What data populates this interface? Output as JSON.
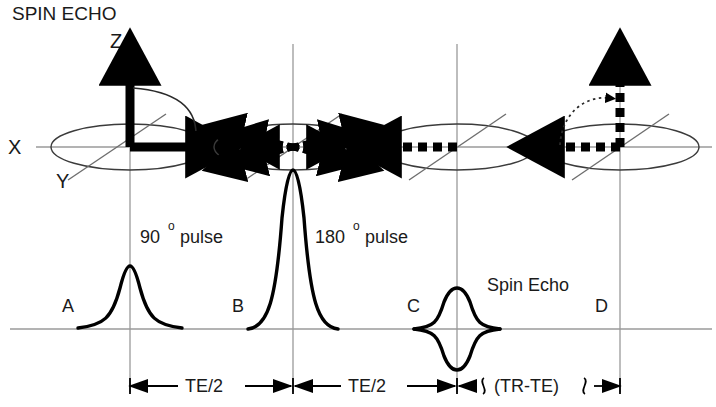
{
  "title": "SPIN ECHO",
  "axes": {
    "z_label": "Z",
    "x_label": "X",
    "y_label": "Y"
  },
  "panels": [
    {
      "letter": "A",
      "state": "longitudinal-magnetization-tipped-to-transverse-plane",
      "center_x": 130
    },
    {
      "letter": "B",
      "state": "spins-dephasing-in-transverse-plane",
      "center_x": 293
    },
    {
      "letter": "C",
      "state": "spins-rephased-echo-formation",
      "center_x": 457
    },
    {
      "letter": "D",
      "state": "longitudinal-recovery-t1-relaxation",
      "center_x": 620
    }
  ],
  "pulses": [
    {
      "name": "ninety-degree-pulse",
      "base_label": "90",
      "degree_symbol": "o",
      "suffix_label": "pulse",
      "center_x": 130,
      "amplitude": 60
    },
    {
      "name": "one-eighty-degree-pulse",
      "base_label": "180",
      "degree_symbol": "o",
      "suffix_label": "pulse",
      "center_x": 293,
      "amplitude": 160
    }
  ],
  "signal": {
    "echo_label": "Spin Echo",
    "echo_center_x": 457,
    "echo_amplitude": 38
  },
  "timing": {
    "segments": [
      {
        "label": "TE/2",
        "from_x": 130,
        "to_x": 293
      },
      {
        "label": "TE/2",
        "from_x": 293,
        "to_x": 457
      },
      {
        "label": "(TR-TE)",
        "from_x": 457,
        "to_x": 620,
        "broken": true
      }
    ]
  },
  "colors": {
    "ink": "#000000",
    "grid": "#9a9a9a",
    "outline": "#3b3b3b",
    "background": "#ffffff"
  }
}
